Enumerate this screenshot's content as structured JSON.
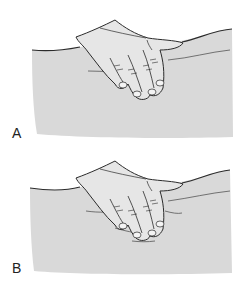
{
  "figure": {
    "panels": [
      {
        "label": "A",
        "description": "hand palpating body surface, fingers flat"
      },
      {
        "label": "B",
        "description": "hand palpating body surface, fingers pressing with skin folds"
      }
    ],
    "colors": {
      "body_fill": "#d9d9d9",
      "hand_fill": "#e6e6e6",
      "outline": "#2b2b2b",
      "background": "#ffffff"
    }
  }
}
